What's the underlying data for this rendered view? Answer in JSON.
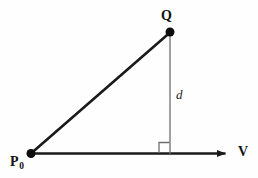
{
  "figure": {
    "background_color": "#fefefe",
    "stroke_color": "#1a1a1a",
    "thin_stroke_color": "#6f6f6f",
    "labels": {
      "point_q": "Q",
      "point_p0_base": "P",
      "point_p0_sub": "0",
      "vector_v": "V",
      "distance_d": "d"
    },
    "geometry": {
      "p0": {
        "x": 31,
        "y": 153.5
      },
      "q": {
        "x": 170,
        "y": 32
      },
      "foot": {
        "x": 170,
        "y": 153.5
      },
      "ray_start": {
        "x": 31,
        "y": 153.5
      },
      "ray_end": {
        "x": 234,
        "y": 153.5
      },
      "right_angle_square": {
        "x": 159,
        "y": 142.5,
        "size": 11
      },
      "dot_radius": 4.4,
      "hypotenuse_width": 2.6,
      "axis_width": 2.6,
      "drop_line_width": 1.2
    }
  }
}
